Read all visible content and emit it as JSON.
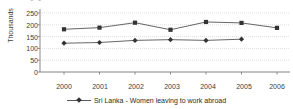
{
  "title_fragment": "▪ ▪",
  "chart_data": {
    "type": "line",
    "title": "",
    "xlabel": "",
    "ylabel": "Thousands",
    "categories": [
      "2000",
      "2001",
      "2002",
      "2003",
      "2004",
      "2005",
      "2006"
    ],
    "ylim": [
      0,
      250
    ],
    "yticks": [
      0,
      50,
      100,
      150,
      200,
      250
    ],
    "ytick_labels": [
      "0",
      "50",
      "100",
      "150",
      "200",
      "250"
    ],
    "grid": true,
    "legend_position": "bottom",
    "series": [
      {
        "name": "Total departures for foreign employment",
        "marker": "square",
        "color": "#333333",
        "x": [
          "2000",
          "2001",
          "2002",
          "2003",
          "2004",
          "2005",
          "2006"
        ],
        "values": [
          181,
          188,
          209,
          179,
          212,
          208,
          187
        ]
      },
      {
        "name": "Sri Lanka - Women leaving to work abroad",
        "marker": "diamond",
        "color": "#333333",
        "x": [
          "2000",
          "2001",
          "2002",
          "2003",
          "2004",
          "2005"
        ],
        "values": [
          122,
          125,
          134,
          137,
          134,
          139
        ]
      }
    ]
  },
  "legend": {
    "label": "Sri Lanka - Women leaving to work abroad",
    "marker": "diamond-marker"
  },
  "axes": {
    "y_title": "Thousands"
  },
  "colors": {
    "line": "#555555",
    "marker": "#333333",
    "grid": "#c9c9c9",
    "axis": "#8a8a8a",
    "text": "#3d3d3d",
    "background": "#ffffff"
  }
}
